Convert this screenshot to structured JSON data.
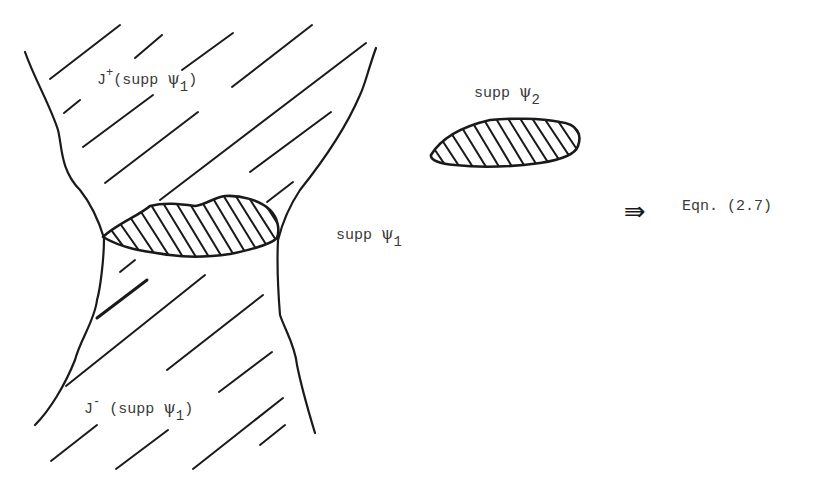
{
  "figure": {
    "labels": {
      "future_cone": {
        "prefix": "J",
        "sup": "+",
        "open": "(supp ",
        "psi": "ψ",
        "sub": "1",
        "close": ")"
      },
      "past_cone": {
        "prefix": "J",
        "sup": "-",
        "open": " (supp ",
        "psi": "ψ",
        "sub": "1",
        "close": ")"
      },
      "supp_psi_1": {
        "text": "supp ",
        "psi": "ψ",
        "sub": "1"
      },
      "supp_psi_2": {
        "text": "supp ",
        "psi": "ψ",
        "sub": "2"
      },
      "implies_arrow": "⇛",
      "equation_ref": "Eqn. (2.7)"
    },
    "colors": {
      "ink": "#1a1a1a",
      "text": "#3a3a3a",
      "background": "#ffffff"
    }
  }
}
